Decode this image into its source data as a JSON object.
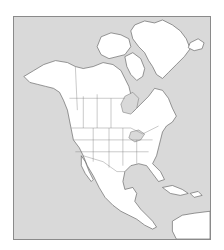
{
  "map": {
    "type": "outline-map",
    "region": "North America",
    "colors": {
      "water": "#d9d9d9",
      "land": "#ffffff",
      "outline": "#555555",
      "frame": "#8a8a8a"
    },
    "features": [
      "Alaska",
      "Canada",
      "Greenland",
      "Iceland",
      "United States",
      "Mexico",
      "Central America",
      "Caribbean islands",
      "Hudson Bay",
      "Gulf of Mexico",
      "Great Lakes",
      "northern South America"
    ]
  }
}
